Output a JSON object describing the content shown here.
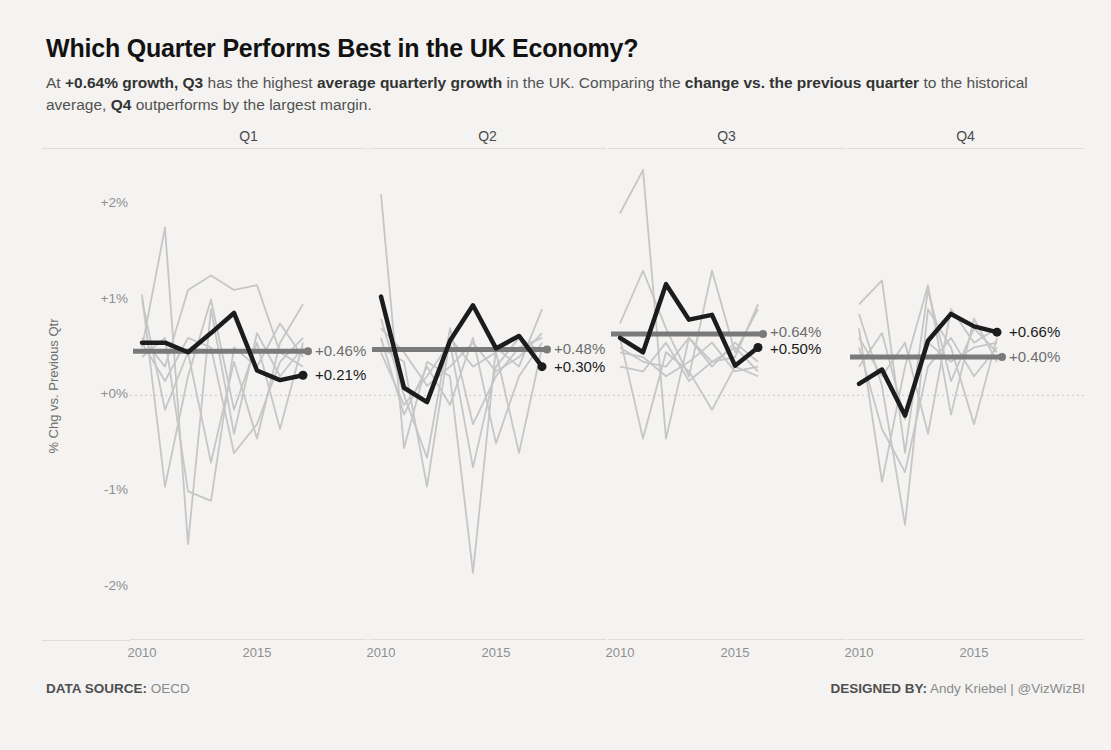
{
  "header": {
    "title": "Which Quarter Performs Best in the UK Economy?",
    "subtitle_segments": [
      {
        "text": "At ",
        "bold": false
      },
      {
        "text": "+0.64% growth,",
        "bold": true
      },
      {
        "text": " ",
        "bold": false
      },
      {
        "text": "Q3",
        "bold": true
      },
      {
        "text": " has the highest ",
        "bold": false
      },
      {
        "text": "average quarterly growth",
        "bold": true
      },
      {
        "text": " in the UK. Comparing the ",
        "bold": false
      },
      {
        "text": "change vs. the previous quarter",
        "bold": true
      },
      {
        "text": " to the historical average, ",
        "bold": false
      },
      {
        "text": "Q4",
        "bold": true
      },
      {
        "text": " outperforms by the largest margin.",
        "bold": false
      }
    ]
  },
  "footer": {
    "source_label": "DATA SOURCE:",
    "source_value": "OECD",
    "designer_label": "DESIGNED BY:",
    "designer_value": "Andy Kriebel | @VizWizBI"
  },
  "chart_data": {
    "type": "line",
    "layout": "small-multiples",
    "ylabel": "% Chg vs. Previous Qtr",
    "ylim": [
      -2.55,
      2.58
    ],
    "grid": "zero-line-only",
    "legend": "none",
    "yticks": [
      {
        "value": 2,
        "label": "+2%"
      },
      {
        "value": 1,
        "label": "+1%"
      },
      {
        "value": 0,
        "label": "+0%"
      },
      {
        "value": -1,
        "label": "-1%"
      },
      {
        "value": -2,
        "label": "-2%"
      }
    ],
    "xticks": [
      {
        "year": 2010,
        "label": "2010"
      },
      {
        "year": 2015,
        "label": "2015"
      }
    ],
    "colors": {
      "highlight": "#1c1c1c",
      "average": "#7a7a7a",
      "context": "#c6c6c6",
      "zero_line": "#c9c9c9"
    },
    "panels": [
      {
        "title": "Q1",
        "years": [
          2010,
          2011,
          2012,
          2013,
          2014,
          2015,
          2016,
          2017
        ],
        "uk": [
          0.55,
          0.55,
          0.45,
          0.65,
          0.86,
          0.26,
          0.16,
          0.21
        ],
        "average": 0.46,
        "average_label": "+0.46%",
        "end_label": "+0.21%",
        "context": [
          [
            0.5,
            1.75,
            -1.55,
            0.9,
            -0.4,
            0.65,
            0.2,
            0.5
          ],
          [
            1.0,
            -0.15,
            0.45,
            -0.7,
            0.35,
            -0.45,
            0.55,
            0.95
          ],
          [
            0.6,
            0.3,
            1.1,
            1.25,
            1.1,
            1.15,
            0.45,
            0.3
          ],
          [
            1.05,
            -0.95,
            0.2,
            1.0,
            -0.15,
            0.55,
            -0.35,
            0.55
          ],
          [
            0.4,
            0.6,
            -1.0,
            -1.1,
            0.5,
            0.3,
            0.75,
            0.4
          ],
          [
            0.55,
            0.15,
            0.6,
            0.5,
            -0.6,
            -0.3,
            0.35,
            0.6
          ]
        ]
      },
      {
        "title": "Q2",
        "years": [
          2010,
          2011,
          2012,
          2013,
          2014,
          2015,
          2016,
          2017
        ],
        "uk": [
          1.03,
          0.08,
          -0.07,
          0.57,
          0.94,
          0.49,
          0.62,
          0.3
        ],
        "average": 0.48,
        "average_label": "+0.48%",
        "end_label": "+0.30%",
        "context": [
          [
            2.1,
            -0.55,
            0.35,
            0.2,
            -1.85,
            0.5,
            0.3,
            0.9
          ],
          [
            0.8,
            0.0,
            -0.65,
            0.7,
            -0.3,
            0.2,
            0.5,
            0.6
          ],
          [
            0.6,
            -0.2,
            0.3,
            -0.1,
            0.6,
            -0.5,
            0.2,
            0.55
          ],
          [
            0.5,
            0.35,
            -0.95,
            0.6,
            0.3,
            0.45,
            -0.6,
            0.5
          ],
          [
            0.45,
            -0.1,
            0.2,
            0.55,
            -0.75,
            0.3,
            0.6,
            0.45
          ],
          [
            0.7,
            0.45,
            0.1,
            0.3,
            0.55,
            0.25,
            0.4,
            0.65
          ]
        ]
      },
      {
        "title": "Q3",
        "years": [
          2010,
          2011,
          2012,
          2013,
          2014,
          2015,
          2016
        ],
        "uk": [
          0.6,
          0.45,
          1.16,
          0.79,
          0.84,
          0.31,
          0.5
        ],
        "average": 0.64,
        "average_label": "+0.64%",
        "end_label": "+0.50%",
        "context": [
          [
            1.9,
            2.35,
            -0.45,
            0.6,
            0.35,
            0.4,
            0.95
          ],
          [
            0.75,
            1.3,
            0.7,
            0.2,
            1.3,
            0.45,
            0.9
          ],
          [
            0.5,
            0.35,
            0.3,
            0.6,
            0.3,
            0.55,
            0.35
          ],
          [
            0.6,
            -0.45,
            0.45,
            0.25,
            -0.15,
            0.3,
            0.2
          ],
          [
            0.45,
            0.4,
            0.2,
            0.35,
            0.55,
            0.25,
            0.3
          ],
          [
            0.3,
            0.25,
            0.55,
            0.15,
            0.35,
            0.5,
            0.25
          ]
        ]
      },
      {
        "title": "Q4",
        "years": [
          2010,
          2011,
          2012,
          2013,
          2014,
          2015,
          2016
        ],
        "uk": [
          0.12,
          0.27,
          -0.21,
          0.57,
          0.85,
          0.72,
          0.66
        ],
        "average": 0.4,
        "average_label": "+0.40%",
        "end_label": "+0.66%",
        "context": [
          [
            0.95,
            1.2,
            -0.6,
            1.1,
            0.15,
            0.7,
            0.45
          ],
          [
            0.7,
            -0.9,
            0.3,
            1.15,
            -0.2,
            0.8,
            0.35
          ],
          [
            0.85,
            0.1,
            -1.35,
            0.9,
            0.5,
            -0.3,
            0.6
          ],
          [
            0.3,
            0.65,
            -0.25,
            0.55,
            0.35,
            0.5,
            0.55
          ],
          [
            0.5,
            -0.35,
            -0.8,
            0.3,
            0.6,
            0.2,
            0.5
          ],
          [
            0.6,
            0.2,
            0.55,
            -0.4,
            0.9,
            0.55,
            0.7
          ]
        ]
      }
    ]
  }
}
